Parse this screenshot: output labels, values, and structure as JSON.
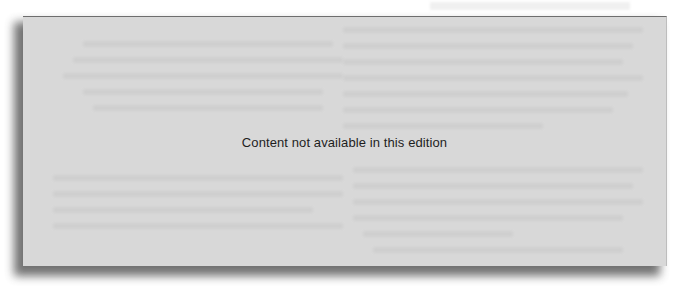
{
  "page": {
    "background": "#ffffff"
  },
  "panel": {
    "fill_color": "#d8d8d8",
    "notice_text": "Content not available in this edition",
    "obscured_text_note": ""
  }
}
